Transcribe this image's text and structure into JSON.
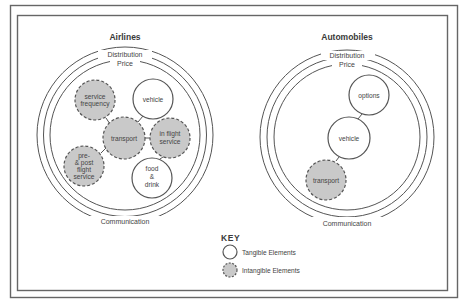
{
  "colors": {
    "line": "#555555",
    "intangible_fill": "#c9c9c9",
    "tangible_fill": "#ffffff",
    "text": "#444444"
  },
  "panels": [
    {
      "title": "Airlines",
      "rings": {
        "outer": "Distribution",
        "middle": "Price",
        "bottom": "Communication"
      },
      "nodes": [
        {
          "id": "service-frequency",
          "lines": [
            "service",
            "frequency"
          ],
          "type": "intangible"
        },
        {
          "id": "vehicle",
          "lines": [
            "vehicle"
          ],
          "type": "tangible"
        },
        {
          "id": "transport",
          "lines": [
            "transport"
          ],
          "type": "intangible"
        },
        {
          "id": "in-flight-service",
          "lines": [
            "in flight",
            "service"
          ],
          "type": "intangible"
        },
        {
          "id": "pre-post-flight-service",
          "lines": [
            "pre-",
            "& post",
            "flight",
            "service"
          ],
          "type": "intangible"
        },
        {
          "id": "food-drink",
          "lines": [
            "food",
            "&",
            "drink"
          ],
          "type": "tangible"
        }
      ]
    },
    {
      "title": "Automobiles",
      "rings": {
        "outer": "Distribution",
        "middle": "Price",
        "bottom": "Communication"
      },
      "nodes": [
        {
          "id": "options",
          "lines": [
            "options"
          ],
          "type": "tangible"
        },
        {
          "id": "vehicle",
          "lines": [
            "vehicle"
          ],
          "type": "tangible"
        },
        {
          "id": "transport",
          "lines": [
            "transport"
          ],
          "type": "intangible"
        }
      ]
    }
  ],
  "key": {
    "title": "KEY",
    "items": [
      {
        "label": "Tangible Elements",
        "type": "tangible"
      },
      {
        "label": "Intangible Elements",
        "type": "intangible"
      }
    ]
  }
}
